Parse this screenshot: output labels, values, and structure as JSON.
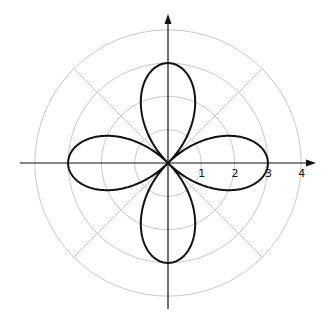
{
  "chart_data": {
    "type": "polar-curve",
    "title": "",
    "equation": "r = 3cos(2θ)",
    "curve": {
      "amplitude": 3,
      "petals": 4,
      "color": "#111111"
    },
    "grid": {
      "circles": [
        1,
        2,
        3,
        4
      ],
      "radial_angles_deg": [
        45,
        135,
        225,
        315
      ],
      "color": "#c8c8c8"
    },
    "axes": {
      "x_ticks": [
        "1",
        "2",
        "3",
        "4"
      ],
      "arrows": true,
      "color": "#111111"
    },
    "r_max": 4
  }
}
